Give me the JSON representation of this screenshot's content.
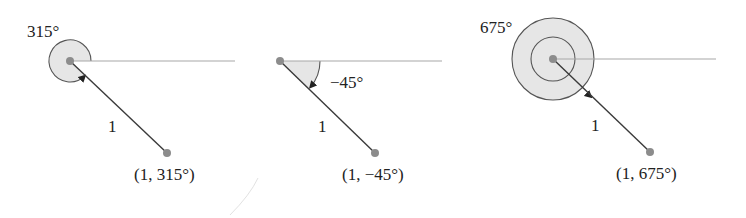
{
  "figures": [
    {
      "id": "panel-315",
      "angle_label": "315°",
      "radius_label": "1",
      "point_label": "(1, 315°)",
      "angle_deg": 315
    },
    {
      "id": "panel-neg45",
      "angle_label": "−45°",
      "radius_label": "1",
      "point_label": "(1, −45°)",
      "angle_deg": -45
    },
    {
      "id": "panel-675",
      "angle_label": "675°",
      "radius_label": "1",
      "point_label": "(1, 675°)",
      "angle_deg": 675
    }
  ],
  "colors": {
    "shade": "#e6e6e6",
    "ray": "#3a3a3a",
    "axis": "#a8a8a8",
    "point": "#8c8c8c",
    "arc": "#555555"
  }
}
